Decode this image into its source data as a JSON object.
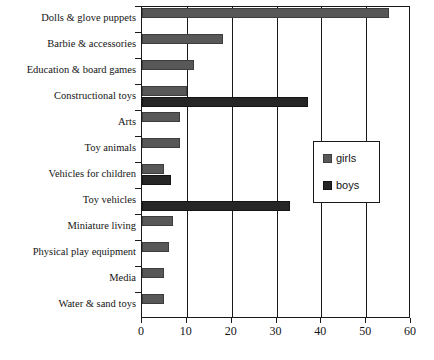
{
  "chart_data": {
    "type": "bar",
    "orientation": "horizontal",
    "title": "",
    "subtitle": "",
    "xlabel": "",
    "ylabel": "",
    "xlim": [
      0,
      60
    ],
    "ylim": null,
    "grid": true,
    "gridlines_axis": "x",
    "legend_position": "right-middle",
    "xticks": [
      0,
      10,
      20,
      30,
      40,
      50,
      60
    ],
    "xticklabels": [
      "0",
      "10",
      "20",
      "30",
      "40",
      "50",
      "60"
    ],
    "categories": [
      "Dolls & glove puppets",
      "Barbie & accessories",
      "Education & board games",
      "Constructional toys",
      "Arts",
      "Toy animals",
      "Vehicles for children",
      "Toy vehicles",
      "Miniature living",
      "Physical play equipment",
      "Media",
      "Water & sand toys"
    ],
    "series": [
      {
        "name": "girls",
        "color": "#585858",
        "values": [
          55,
          18,
          11.5,
          10,
          8.5,
          8.5,
          5,
          0,
          7,
          6,
          5,
          5
        ]
      },
      {
        "name": "boys",
        "color": "#262626",
        "values": [
          0,
          0,
          0,
          37,
          0,
          0,
          6.5,
          33,
          0,
          0,
          0,
          0
        ]
      }
    ]
  },
  "legend": {
    "entries": [
      {
        "label": "girls",
        "swatch": "girls"
      },
      {
        "label": "boys",
        "swatch": "boys"
      }
    ]
  },
  "colors": {
    "girls": "#585858",
    "boys": "#262626",
    "axis": "#1a1a1a",
    "background": "#ffffff"
  }
}
